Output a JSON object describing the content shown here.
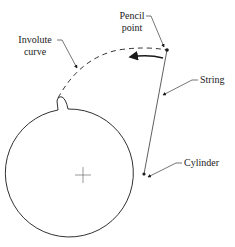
{
  "diagram": {
    "labels": {
      "pencil_point_line1": "Pencil",
      "pencil_point_line2": "point",
      "involute_line1": "Involute",
      "involute_line2": "curve",
      "string": "String",
      "cylinder": "Cylinder"
    },
    "elements": {
      "cylinder_center": [
        83,
        175
      ],
      "cylinder_radius": 64,
      "pencil_point": [
        167,
        50
      ],
      "tangent_point": [
        144,
        174
      ]
    },
    "colors": {
      "stroke": "#1a1a1a",
      "background": "#ffffff"
    }
  }
}
